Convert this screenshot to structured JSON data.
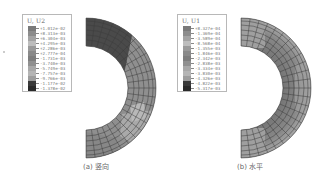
{
  "figure": {
    "panels": [
      {
        "id": "a",
        "caption": "(a) 竖向",
        "legend": {
          "title": "U, U2",
          "values": [
            "+1.012e-02",
            "+8.313e-03",
            "+6.304e-03",
            "+4.295e-03",
            "+2.286e-03",
            "+2.777e-04",
            "-1.731e-03",
            "-3.740e-03",
            "-5.749e-03",
            "-7.757e-03",
            "-9.766e-03",
            "-1.177e-02",
            "-1.378e-02"
          ],
          "colors": [
            "#7a7a7a",
            "#8c8c8c",
            "#a3a3a3",
            "#bdbdbd",
            "#9a9a9a",
            "#8a8a8a",
            "#7e7e7e",
            "#909090",
            "#a8a8a8",
            "#b5b5b5",
            "#9d9d9d",
            "#3a3a3a",
            "#2a2a2a"
          ]
        },
        "contour": {
          "dominant_color": "#8f8f8f",
          "top_region_color": "#4a4a4a",
          "light_region_color": "#b4b4b4",
          "mesh_color": "#3c3c3c"
        }
      },
      {
        "id": "b",
        "caption": "(b) 水平",
        "legend": {
          "title": "U, U1",
          "values": [
            "+8.327e-04",
            "-1.369e-04",
            "-3.589e-04",
            "-8.568e-04",
            "-1.355e-03",
            "-1.846e-03",
            "-2.342e-03",
            "-2.838e-03",
            "-3.334e-03",
            "-3.830e-03",
            "-4.326e-03",
            "-4.822e-03",
            "-5.317e-03"
          ],
          "colors": [
            "#7a7a7a",
            "#8c8c8c",
            "#a3a3a3",
            "#bdbdbd",
            "#9a9a9a",
            "#8a8a8a",
            "#7e7e7e",
            "#909090",
            "#a8a8a8",
            "#b5b5b5",
            "#9d9d9d",
            "#3a3a3a",
            "#2a2a2a"
          ]
        },
        "contour": {
          "dominant_color": "#7f7f7f",
          "end_region_color": "#a6a6a6",
          "outer_edge_color": "#b0b0b0",
          "mesh_color": "#3c3c3c"
        }
      }
    ]
  }
}
